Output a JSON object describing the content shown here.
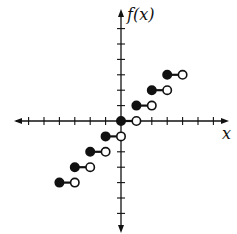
{
  "chart_data": {
    "type": "line",
    "subtype": "step-function",
    "title": "",
    "xlabel": "x",
    "ylabel": "f(x)",
    "xlim": [
      -6,
      6
    ],
    "ylim": [
      -6,
      6
    ],
    "x_ticks": [
      -6,
      -5,
      -4,
      -3,
      -2,
      -1,
      1,
      2,
      3,
      4,
      5,
      6
    ],
    "y_ticks": [
      -6,
      -5,
      -4,
      -3,
      -2,
      -1,
      1,
      2,
      3,
      4,
      5,
      6
    ],
    "grid": false,
    "legend": null,
    "segments": [
      {
        "x_start": -4,
        "x_end": -3,
        "y": -4,
        "start_closed": true,
        "end_closed": false
      },
      {
        "x_start": -3,
        "x_end": -2,
        "y": -3,
        "start_closed": true,
        "end_closed": false
      },
      {
        "x_start": -2,
        "x_end": -1,
        "y": -2,
        "start_closed": true,
        "end_closed": false
      },
      {
        "x_start": -1,
        "x_end": 0,
        "y": -1,
        "start_closed": true,
        "end_closed": false
      },
      {
        "x_start": 0,
        "x_end": 1,
        "y": 0,
        "start_closed": true,
        "end_closed": false
      },
      {
        "x_start": 1,
        "x_end": 2,
        "y": 1,
        "start_closed": true,
        "end_closed": false
      },
      {
        "x_start": 2,
        "x_end": 3,
        "y": 2,
        "start_closed": true,
        "end_closed": false
      },
      {
        "x_start": 3,
        "x_end": 4,
        "y": 3,
        "start_closed": true,
        "end_closed": false
      }
    ]
  },
  "axes": {
    "x_label": "x",
    "y_label": "f(x)"
  },
  "colors": {
    "ink": "#111111",
    "background": "#ffffff"
  }
}
